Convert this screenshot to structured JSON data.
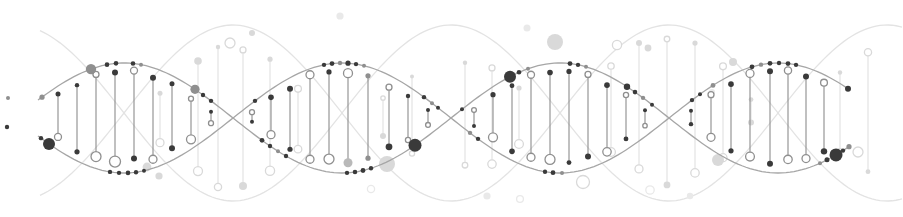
{
  "illustration": {
    "description": "dna-double-helix-decorative-graphic",
    "canvas": {
      "width": 903,
      "height": 217,
      "background": "#ffffff"
    },
    "tones": {
      "dark": "#3a3a3a",
      "mid": "#8f8f8f",
      "soft": "#b9b9b9",
      "light": "#d9d9d9",
      "xlight": "#e9e9e9"
    },
    "main_helix": {
      "x0": 15,
      "half_period": 218,
      "midline": 118,
      "amplitude": 55,
      "x_start": 38,
      "x_end": 850,
      "stroke": "#a6a6a6",
      "stroke_width": 1.3,
      "rung_stroke": "#8c8c8c",
      "rung_width": 1.1
    },
    "light_helix": {
      "x0": 124,
      "half_period": 218,
      "midline": 113,
      "amplitude": 88,
      "x_start": 40,
      "x_end": 902,
      "stroke": "#e3e3e3",
      "stroke_width": 1.3,
      "rung_stroke": "#e0e0e0",
      "rung_width": 1.1
    },
    "rung_format": "[x, top_inset, bottom_inset, top_shape, top_r, top_tone, bottom_shape, bottom_r, bottom_tone]",
    "main_rungs": [
      [
        58,
        8,
        13,
        "dot",
        2.5,
        "dark",
        "ring",
        3.5,
        "mid"
      ],
      [
        77,
        10,
        9,
        "dot",
        2.2,
        "dark",
        "dot",
        2.6,
        "dark"
      ],
      [
        96,
        7,
        12,
        "ring",
        3.0,
        "mid",
        "ring",
        5.0,
        "mid"
      ],
      [
        115,
        9,
        11,
        "dot",
        3.0,
        "dark",
        "ring",
        5.5,
        "mid"
      ],
      [
        134,
        7,
        14,
        "ring",
        3.5,
        "mid",
        "dot",
        3.0,
        "dark"
      ],
      [
        153,
        10,
        9,
        "dot",
        3.0,
        "dark",
        "ring",
        4.0,
        "mid"
      ],
      [
        172,
        8,
        12,
        "dot",
        2.5,
        "dark",
        "dot",
        3.0,
        "dark"
      ],
      [
        191,
        12,
        10,
        "ring",
        2.5,
        "mid",
        "ring",
        4.5,
        "mid"
      ],
      [
        211,
        11,
        12,
        "dot",
        2.0,
        "dark",
        "ring",
        2.5,
        "mid"
      ],
      [
        252,
        9,
        11,
        "ring",
        2.5,
        "mid",
        "dot",
        2.0,
        "dark"
      ],
      [
        271,
        8,
        12,
        "dot",
        2.8,
        "dark",
        "ring",
        4.0,
        "mid"
      ],
      [
        290,
        11,
        9,
        "dot",
        3.0,
        "dark",
        "dot",
        2.6,
        "dark"
      ],
      [
        310,
        6,
        8,
        "ring",
        4.0,
        "mid",
        "ring",
        4.0,
        "mid"
      ],
      [
        329,
        8,
        13,
        "dot",
        2.6,
        "dark",
        "ring",
        5.0,
        "mid"
      ],
      [
        348,
        10,
        10,
        "ring",
        4.5,
        "mid",
        "dot",
        4.5,
        "soft"
      ],
      [
        368,
        9,
        11,
        "dot",
        2.6,
        "mid",
        "dot",
        2.6,
        "mid"
      ],
      [
        389,
        12,
        14,
        "ring",
        3.0,
        "mid",
        "dot",
        3.4,
        "dark"
      ],
      [
        408,
        10,
        10,
        "dot",
        2.2,
        "dark",
        "ring",
        2.6,
        "mid"
      ],
      [
        428,
        10,
        11,
        "dot",
        2.0,
        "dark",
        "ring",
        2.4,
        "mid"
      ],
      [
        474,
        10,
        10,
        "ring",
        2.4,
        "mid",
        "dot",
        2.0,
        "dark"
      ],
      [
        493,
        8,
        12,
        "dot",
        2.6,
        "dark",
        "ring",
        4.5,
        "mid"
      ],
      [
        512,
        10,
        9,
        "dot",
        2.4,
        "dark",
        "dot",
        2.8,
        "dark"
      ],
      [
        531,
        7,
        11,
        "ring",
        3.5,
        "mid",
        "ring",
        4.0,
        "mid"
      ],
      [
        550,
        9,
        13,
        "dot",
        2.8,
        "dark",
        "ring",
        5.0,
        "mid"
      ],
      [
        569,
        8,
        10,
        "dot",
        2.6,
        "dark",
        "dot",
        2.4,
        "dark"
      ],
      [
        588,
        7,
        12,
        "ring",
        3.0,
        "mid",
        "dot",
        3.0,
        "dark"
      ],
      [
        607,
        10,
        9,
        "dot",
        2.8,
        "dark",
        "ring",
        4.2,
        "mid"
      ],
      [
        626,
        9,
        11,
        "ring",
        2.6,
        "mid",
        "dot",
        2.4,
        "dark"
      ],
      [
        645,
        11,
        11,
        "dot",
        2.0,
        "dark",
        "ring",
        2.2,
        "mid"
      ],
      [
        691,
        10,
        11,
        "dot",
        2.0,
        "dark",
        "dot",
        2.2,
        "dark"
      ],
      [
        711,
        8,
        12,
        "ring",
        3.0,
        "mid",
        "ring",
        4.0,
        "mid"
      ],
      [
        731,
        9,
        10,
        "dot",
        2.8,
        "dark",
        "dot",
        2.6,
        "dark"
      ],
      [
        750,
        6,
        12,
        "ring",
        4.0,
        "mid",
        "ring",
        4.4,
        "mid"
      ],
      [
        770,
        8,
        9,
        "dot",
        3.0,
        "dark",
        "dot",
        3.0,
        "dark"
      ],
      [
        788,
        7,
        13,
        "ring",
        3.6,
        "mid",
        "ring",
        4.2,
        "mid"
      ],
      [
        806,
        9,
        10,
        "dot",
        3.0,
        "dark",
        "ring",
        4.0,
        "mid"
      ],
      [
        824,
        8,
        10,
        "ring",
        3.4,
        "mid",
        "dot",
        3.2,
        "dark"
      ]
    ],
    "light_rungs": [
      [
        160,
        24,
        14,
        "dot",
        2.5,
        "light",
        "ring",
        4.0,
        "light"
      ],
      [
        198,
        25,
        19,
        "dot",
        3.8,
        "light",
        "ring",
        4.5,
        "light"
      ],
      [
        218,
        20,
        12,
        "dot",
        2.2,
        "light",
        "ring",
        3.6,
        "light"
      ],
      [
        243,
        24,
        14,
        "ring",
        3.0,
        "light",
        "dot",
        4.0,
        "light"
      ],
      [
        270,
        22,
        18,
        "dot",
        2.6,
        "light",
        "ring",
        4.6,
        "light"
      ],
      [
        298,
        28,
        16,
        "ring",
        3.4,
        "light",
        "ring",
        3.8,
        "light"
      ],
      [
        325,
        30,
        14,
        "dot",
        2.2,
        "light",
        "ring",
        4.0,
        "light"
      ],
      [
        383,
        34,
        26,
        "ring",
        2.2,
        "light",
        "dot",
        3.0,
        "light"
      ],
      [
        412,
        38,
        34,
        "dot",
        2.0,
        "light",
        "ring",
        2.6,
        "light"
      ],
      [
        465,
        36,
        34,
        "dot",
        2.2,
        "light",
        "ring",
        2.8,
        "light"
      ],
      [
        492,
        28,
        22,
        "ring",
        3.0,
        "light",
        "ring",
        4.2,
        "light"
      ],
      [
        519,
        24,
        18,
        "dot",
        2.6,
        "light",
        "ring",
        4.4,
        "light"
      ],
      [
        546,
        20,
        16,
        "ring",
        4.0,
        "light",
        "ring",
        4.6,
        "light"
      ],
      [
        611,
        12,
        20,
        "ring",
        3.2,
        "light",
        "ring",
        4.4,
        "light"
      ],
      [
        639,
        10,
        24,
        "dot",
        3.0,
        "light",
        "ring",
        4.0,
        "light"
      ],
      [
        667,
        14,
        16,
        "ring",
        2.8,
        "light",
        "dot",
        3.4,
        "light"
      ],
      [
        695,
        12,
        22,
        "dot",
        2.6,
        "light",
        "ring",
        4.2,
        "light"
      ],
      [
        723,
        16,
        18,
        "ring",
        3.4,
        "light",
        "ring",
        4.0,
        "light"
      ],
      [
        751,
        20,
        24,
        "dot",
        2.4,
        "light",
        "dot",
        3.0,
        "light"
      ],
      [
        840,
        28,
        30,
        "dot",
        2.2,
        "light",
        "ring",
        3.0,
        "light"
      ],
      [
        868,
        24,
        26,
        "ring",
        3.6,
        "light",
        "dot",
        2.4,
        "light"
      ]
    ],
    "strand_dot_format": "[x, strand(A|B), tone, r]",
    "strand_dots": [
      [
        42,
        "A",
        "mid",
        2.6
      ],
      [
        41,
        "B",
        "dark",
        2.2
      ],
      [
        49,
        "B",
        "dark",
        6.0
      ],
      [
        91,
        "A",
        "mid",
        5.2
      ],
      [
        107,
        "A",
        "dark",
        2.3
      ],
      [
        116,
        "A",
        "dark",
        2.3
      ],
      [
        133,
        "A",
        "dark",
        2.3
      ],
      [
        141,
        "A",
        "mid",
        2.0
      ],
      [
        110,
        "B",
        "dark",
        2.2
      ],
      [
        119,
        "B",
        "dark",
        2.2
      ],
      [
        128,
        "B",
        "dark",
        2.3
      ],
      [
        136,
        "B",
        "dark",
        2.2
      ],
      [
        144,
        "B",
        "dark",
        2.0
      ],
      [
        195,
        "A",
        "mid",
        4.6
      ],
      [
        203,
        "A",
        "dark",
        2.2
      ],
      [
        211,
        "A",
        "dark",
        2.2
      ],
      [
        255,
        "B",
        "dark",
        2.2
      ],
      [
        262,
        "A",
        "dark",
        2.4
      ],
      [
        270,
        "A",
        "dark",
        2.2
      ],
      [
        278,
        "A",
        "mid",
        2.0
      ],
      [
        286,
        "A",
        "dark",
        2.2
      ],
      [
        324,
        "B",
        "dark",
        2.2
      ],
      [
        332,
        "B",
        "dark",
        2.4
      ],
      [
        340,
        "B",
        "mid",
        2.2
      ],
      [
        348,
        "B",
        "dark",
        2.6
      ],
      [
        356,
        "B",
        "dark",
        2.2
      ],
      [
        364,
        "B",
        "mid",
        2.0
      ],
      [
        347,
        "A",
        "dark",
        2.2
      ],
      [
        355,
        "A",
        "dark",
        2.3
      ],
      [
        363,
        "A",
        "dark",
        2.4
      ],
      [
        371,
        "A",
        "dark",
        2.2
      ],
      [
        415,
        "A",
        "dark",
        6.5
      ],
      [
        424,
        "B",
        "dark",
        2.2
      ],
      [
        432,
        "B",
        "mid",
        2.0
      ],
      [
        438,
        "B",
        "dark",
        2.0
      ],
      [
        470,
        "B",
        "mid",
        2.2
      ],
      [
        478,
        "B",
        "dark",
        2.2
      ],
      [
        462,
        "A",
        "dark",
        2.0
      ],
      [
        510,
        "A",
        "dark",
        6.0
      ],
      [
        519,
        "A",
        "dark",
        2.3
      ],
      [
        528,
        "A",
        "mid",
        2.0
      ],
      [
        570,
        "A",
        "dark",
        2.4
      ],
      [
        578,
        "A",
        "dark",
        2.2
      ],
      [
        586,
        "A",
        "mid",
        2.0
      ],
      [
        545,
        "B",
        "dark",
        2.2
      ],
      [
        553,
        "B",
        "dark",
        2.4
      ],
      [
        562,
        "B",
        "mid",
        2.0
      ],
      [
        627,
        "A",
        "dark",
        3.2
      ],
      [
        635,
        "A",
        "dark",
        2.3
      ],
      [
        643,
        "A",
        "mid",
        2.2
      ],
      [
        652,
        "A",
        "dark",
        2.0
      ],
      [
        692,
        "B",
        "dark",
        2.2
      ],
      [
        700,
        "B",
        "dark",
        2.0
      ],
      [
        713,
        "B",
        "mid",
        2.4
      ],
      [
        752,
        "B",
        "dark",
        2.4
      ],
      [
        761,
        "B",
        "mid",
        2.2
      ],
      [
        770,
        "B",
        "dark",
        2.4
      ],
      [
        779,
        "B",
        "dark",
        2.2
      ],
      [
        788,
        "B",
        "dark",
        2.4
      ],
      [
        796,
        "B",
        "dark",
        2.2
      ],
      [
        820,
        "A",
        "mid",
        2.0
      ],
      [
        827,
        "A",
        "dark",
        2.5
      ],
      [
        836,
        "A",
        "dark",
        6.5
      ],
      [
        843,
        "A",
        "dark",
        2.2
      ],
      [
        849,
        "A",
        "mid",
        2.6
      ],
      [
        848,
        "B",
        "dark",
        3.0
      ]
    ],
    "floating_dot_format": "[x, y, shape(dot|ring), tone, r]",
    "floating_dots": [
      [
        8,
        98,
        "dot",
        "mid",
        2.0
      ],
      [
        7,
        127,
        "dot",
        "dark",
        2.2
      ],
      [
        147,
        167,
        "dot",
        "light",
        4.4
      ],
      [
        159,
        176,
        "dot",
        "light",
        3.6
      ],
      [
        230,
        43,
        "ring",
        "light",
        5.0
      ],
      [
        252,
        33,
        "dot",
        "light",
        3.0
      ],
      [
        340,
        16,
        "dot",
        "xlight",
        3.6
      ],
      [
        371,
        189,
        "ring",
        "xlight",
        3.6
      ],
      [
        387,
        164,
        "dot",
        "light",
        8.0
      ],
      [
        487,
        196,
        "dot",
        "xlight",
        3.6
      ],
      [
        520,
        199,
        "ring",
        "xlight",
        3.4
      ],
      [
        527,
        28,
        "dot",
        "xlight",
        3.5
      ],
      [
        555,
        42,
        "dot",
        "light",
        8.0
      ],
      [
        583,
        182,
        "ring",
        "light",
        6.5
      ],
      [
        617,
        45,
        "ring",
        "light",
        4.6
      ],
      [
        648,
        48,
        "dot",
        "light",
        3.4
      ],
      [
        650,
        190,
        "ring",
        "xlight",
        4.2
      ],
      [
        690,
        196,
        "dot",
        "xlight",
        3.2
      ],
      [
        712,
        92,
        "dot",
        "xlight",
        3.0
      ],
      [
        718,
        160,
        "dot",
        "light",
        6.0
      ],
      [
        733,
        62,
        "dot",
        "light",
        4.0
      ],
      [
        858,
        152,
        "ring",
        "light",
        5.0
      ]
    ]
  }
}
